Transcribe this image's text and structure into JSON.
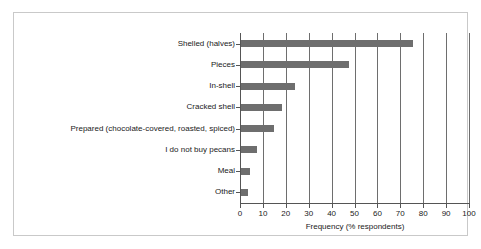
{
  "chart_data": {
    "type": "bar",
    "orientation": "horizontal",
    "title": "",
    "subtitle": "",
    "xlabel": "Frequency (% respondents)",
    "ylabel": "",
    "categories": [
      "Shelled (halves)",
      "Pieces",
      "In-shell",
      "Cracked shell",
      "Prepared (chocolate-covered, roasted, spiced)",
      "I do not buy pecans",
      "Meal",
      "Other"
    ],
    "values": [
      75,
      47,
      23.5,
      18,
      14.5,
      7,
      4,
      3
    ],
    "xlim": [
      0,
      100
    ],
    "xticks": [
      0,
      10,
      20,
      30,
      40,
      50,
      60,
      70,
      80,
      90,
      100
    ],
    "xticklabels": [
      "0",
      "10",
      "20",
      "30",
      "40",
      "50",
      "60",
      "70",
      "80",
      "90",
      "100"
    ],
    "grid": "vertical",
    "legend": "none",
    "bar_color": "#6e6e6e",
    "axis_color": "#555555",
    "gridline_color": "#6e6e6e",
    "frame_color": "#c9c9c9",
    "background": "#ffffff",
    "text_color": "#1a1a1a"
  }
}
